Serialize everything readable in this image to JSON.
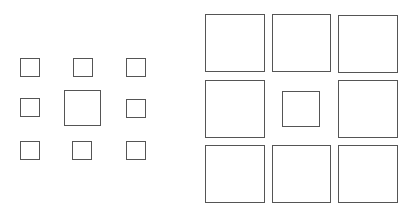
{
  "diagram": {
    "stroke_color": "#555555",
    "background": "#ffffff",
    "figures": [
      {
        "name": "left-figure",
        "description": "Large center square surrounded by eight small squares",
        "boxes": [
          {
            "role": "surround",
            "x": 20,
            "y": 58,
            "w": 20,
            "h": 19
          },
          {
            "role": "surround",
            "x": 73,
            "y": 58,
            "w": 20,
            "h": 19
          },
          {
            "role": "surround",
            "x": 126,
            "y": 58,
            "w": 20,
            "h": 19
          },
          {
            "role": "surround",
            "x": 20,
            "y": 98,
            "w": 20,
            "h": 19
          },
          {
            "role": "center",
            "x": 64,
            "y": 90,
            "w": 37,
            "h": 36
          },
          {
            "role": "surround",
            "x": 126,
            "y": 99,
            "w": 20,
            "h": 19
          },
          {
            "role": "surround",
            "x": 20,
            "y": 141,
            "w": 20,
            "h": 19
          },
          {
            "role": "surround",
            "x": 72,
            "y": 141,
            "w": 20,
            "h": 19
          },
          {
            "role": "surround",
            "x": 126,
            "y": 141,
            "w": 20,
            "h": 19
          }
        ]
      },
      {
        "name": "right-figure",
        "description": "Small center square surrounded by eight large squares",
        "boxes": [
          {
            "role": "surround",
            "x": 205,
            "y": 14,
            "w": 60,
            "h": 58
          },
          {
            "role": "surround",
            "x": 272,
            "y": 14,
            "w": 59,
            "h": 58
          },
          {
            "role": "surround",
            "x": 338,
            "y": 15,
            "w": 60,
            "h": 58
          },
          {
            "role": "surround",
            "x": 205,
            "y": 80,
            "w": 60,
            "h": 58
          },
          {
            "role": "center",
            "x": 282,
            "y": 91,
            "w": 38,
            "h": 36
          },
          {
            "role": "surround",
            "x": 338,
            "y": 80,
            "w": 60,
            "h": 58
          },
          {
            "role": "surround",
            "x": 205,
            "y": 145,
            "w": 60,
            "h": 58
          },
          {
            "role": "surround",
            "x": 272,
            "y": 145,
            "w": 59,
            "h": 58
          },
          {
            "role": "surround",
            "x": 338,
            "y": 145,
            "w": 60,
            "h": 58
          }
        ]
      }
    ]
  }
}
